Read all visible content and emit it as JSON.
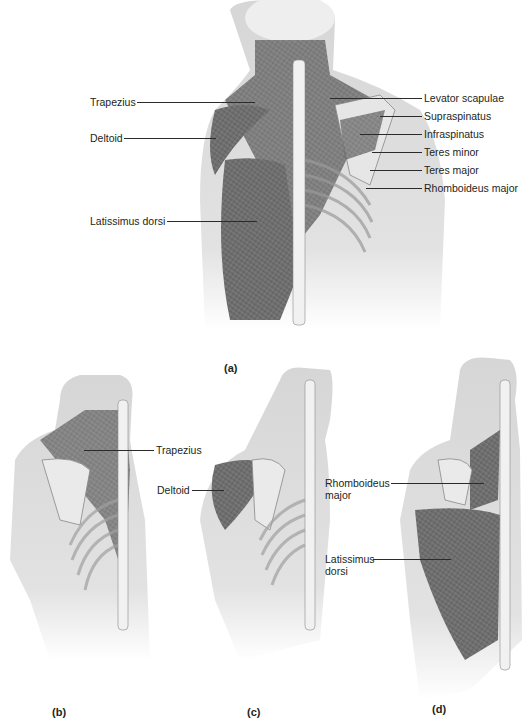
{
  "figure": {
    "panels": [
      {
        "id": "a",
        "caption": "(a)",
        "labels_left": [
          "Trapezius",
          "Deltoid",
          "Latissimus dorsi"
        ],
        "labels_right": [
          "Levator scapulae",
          "Supraspinatus",
          "Infraspinatus",
          "Teres minor",
          "Teres major",
          "Rhomboideus major"
        ]
      },
      {
        "id": "b",
        "caption": "(b)",
        "labels": [
          "Trapezius"
        ]
      },
      {
        "id": "c",
        "caption": "(c)",
        "labels": [
          "Deltoid"
        ]
      },
      {
        "id": "d",
        "caption": "(d)",
        "labels": [
          "Rhomboideus major",
          "Latissimus dorsi"
        ]
      }
    ]
  },
  "colors": {
    "muscle": "#6e6e6e",
    "bone": "#e8e8e8",
    "skin": "#cfcfcf",
    "text": "#231f20"
  }
}
